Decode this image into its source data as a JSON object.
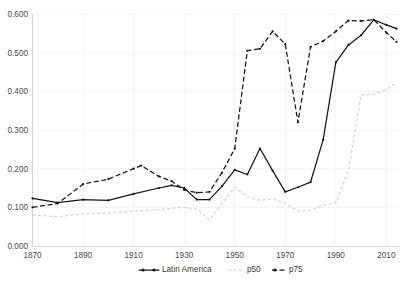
{
  "chart_data": {
    "type": "line",
    "title": "",
    "subtitle": "",
    "xlabel": "",
    "ylabel": "",
    "xlim": [
      1870,
      2015
    ],
    "ylim": [
      0.0,
      0.6
    ],
    "grid": true,
    "legend_position": "bottom",
    "x_ticks": [
      "1870",
      "1890",
      "1910",
      "1930",
      "1950",
      "1970",
      "1990",
      "2010"
    ],
    "x_tick_values": [
      1870,
      1890,
      1910,
      1930,
      1950,
      1970,
      1990,
      2010
    ],
    "y_ticks": [
      "0.000",
      "0.100",
      "0.200",
      "0.300",
      "0.400",
      "0.500",
      "0.600"
    ],
    "y_tick_values": [
      0.0,
      0.1,
      0.2,
      0.3,
      0.4,
      0.5,
      0.6
    ],
    "series": [
      {
        "name": "Latin America",
        "style": "solid-with-markers",
        "color": "#161616",
        "x": [
          1870,
          1880,
          1890,
          1900,
          1910,
          1920,
          1925,
          1930,
          1935,
          1940,
          1945,
          1950,
          1955,
          1960,
          1965,
          1970,
          1975,
          1980,
          1985,
          1990,
          1995,
          2000,
          2005,
          2010,
          2014
        ],
        "values": [
          0.123,
          0.112,
          0.12,
          0.118,
          0.135,
          0.15,
          0.157,
          0.15,
          0.12,
          0.12,
          0.155,
          0.197,
          0.185,
          0.252,
          0.195,
          0.14,
          0.152,
          0.165,
          0.275,
          0.475,
          0.52,
          0.545,
          0.585,
          0.572,
          0.562
        ]
      },
      {
        "name": "p50",
        "style": "dashed-light",
        "color": "#d3d3d3",
        "x": [
          1870,
          1880,
          1890,
          1900,
          1910,
          1920,
          1925,
          1930,
          1935,
          1940,
          1945,
          1950,
          1955,
          1960,
          1965,
          1970,
          1975,
          1980,
          1985,
          1990,
          1995,
          2000,
          2005,
          2010,
          2014
        ],
        "values": [
          0.08,
          0.076,
          0.083,
          0.086,
          0.09,
          0.094,
          0.098,
          0.1,
          0.095,
          0.068,
          0.11,
          0.152,
          0.128,
          0.118,
          0.122,
          0.11,
          0.09,
          0.093,
          0.105,
          0.112,
          0.195,
          0.39,
          0.393,
          0.405,
          0.422
        ]
      },
      {
        "name": "p75",
        "style": "dashed-with-markers",
        "color": "#161616",
        "x": [
          1870,
          1880,
          1890,
          1900,
          1910,
          1913,
          1920,
          1925,
          1930,
          1935,
          1940,
          1945,
          1950,
          1955,
          1960,
          1965,
          1970,
          1975,
          1980,
          1985,
          1990,
          1995,
          2000,
          2005,
          2010,
          2014
        ],
        "values": [
          0.1,
          0.11,
          0.16,
          0.173,
          0.2,
          0.208,
          0.18,
          0.168,
          0.145,
          0.138,
          0.14,
          0.19,
          0.252,
          0.505,
          0.51,
          0.555,
          0.522,
          0.32,
          0.515,
          0.53,
          0.555,
          0.583,
          0.582,
          0.585,
          0.552,
          0.528
        ]
      }
    ]
  },
  "legend": {
    "items": [
      {
        "label": "Latin America",
        "marker": "line-solid-marker"
      },
      {
        "label": "p50",
        "marker": "line-dashed-light"
      },
      {
        "label": "p75",
        "marker": "line-dashed-marker"
      }
    ]
  }
}
